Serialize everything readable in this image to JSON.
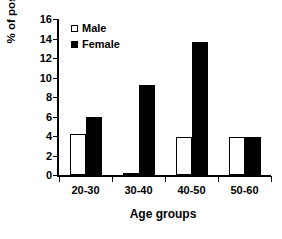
{
  "chart_data": {
    "type": "bar",
    "title": "",
    "xlabel": "Age groups",
    "ylabel": "% of positive",
    "categories": [
      "20-30",
      "30-40",
      "40-50",
      "50-60"
    ],
    "series": [
      {
        "name": "Male",
        "values": [
          4.2,
          0.1,
          3.9,
          3.9
        ],
        "color": "#ffffff"
      },
      {
        "name": "Female",
        "values": [
          5.9,
          9.2,
          13.6,
          3.9
        ],
        "color": "#000000"
      }
    ],
    "ylim": [
      0,
      16
    ],
    "yticks": [
      0,
      2,
      4,
      6,
      8,
      10,
      12,
      14,
      16
    ],
    "ytick_labels": [
      "0",
      "2",
      "4",
      "6",
      "8",
      "10",
      "12",
      "14",
      "16"
    ],
    "grid": false,
    "legend_position": "top-left",
    "legend_entries": [
      "Male",
      "Female"
    ]
  }
}
